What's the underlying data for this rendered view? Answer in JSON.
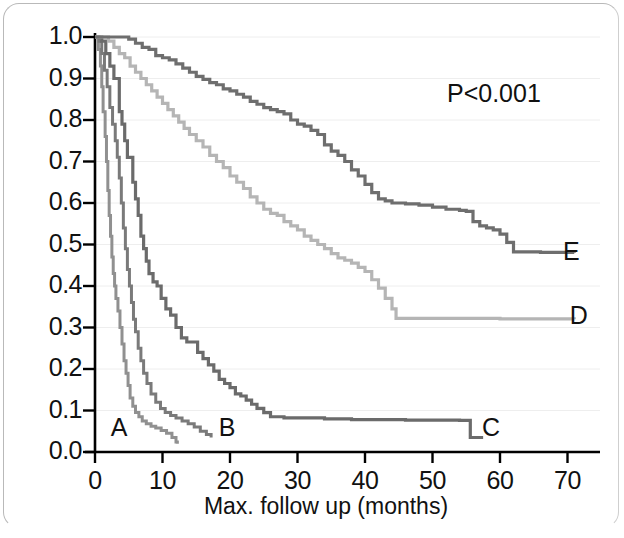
{
  "figure": {
    "annotation_pvalue": "P<0.001",
    "frame_color": "#b9b9b9",
    "background": "#ffffff"
  },
  "chart_data": {
    "type": "line",
    "subtype": "kaplan-meier-step",
    "title": "",
    "xlabel": "Max. follow up (months)",
    "ylabel": "",
    "xlim": [
      0,
      73
    ],
    "ylim": [
      0.0,
      1.0
    ],
    "xticks": [
      0,
      10,
      20,
      30,
      40,
      50,
      60,
      70
    ],
    "xticklabels": [
      "0",
      "10",
      "20",
      "30",
      "40",
      "50",
      "60",
      "70"
    ],
    "yticks": [
      0.0,
      0.1,
      0.2,
      0.3,
      0.4,
      0.5,
      0.6,
      0.7,
      0.8,
      0.9,
      1.0
    ],
    "yticklabels": [
      "0.0",
      "0.1",
      "0.2",
      "0.3",
      "0.4",
      "0.5",
      "0.6",
      "0.7",
      "0.8",
      "0.9",
      "1.0"
    ],
    "grid": "horizontal-faint",
    "grid_color": "#eeeeee",
    "legend": "inline-end-labels",
    "annotations": [
      {
        "text": "P<0.001",
        "x": 53,
        "y": 0.89
      },
      {
        "text": "A",
        "x": 3.5,
        "y": 0.055
      },
      {
        "text": "B",
        "x": 19.5,
        "y": 0.055
      },
      {
        "text": "C",
        "x": 58.5,
        "y": 0.055
      },
      {
        "text": "D",
        "x": 71.5,
        "y": 0.325
      },
      {
        "text": "E",
        "x": 70.5,
        "y": 0.48
      }
    ],
    "series": [
      {
        "name": "A",
        "label": "A",
        "color": "#909090",
        "width": 3.0,
        "final_value": 0.02,
        "final_time": 12.2,
        "points": [
          [
            0.0,
            1.0
          ],
          [
            0.5,
            0.97
          ],
          [
            0.8,
            0.93
          ],
          [
            1.0,
            0.88
          ],
          [
            1.2,
            0.82
          ],
          [
            1.5,
            0.76
          ],
          [
            1.7,
            0.7
          ],
          [
            1.9,
            0.63
          ],
          [
            2.1,
            0.57
          ],
          [
            2.3,
            0.52
          ],
          [
            2.5,
            0.47
          ],
          [
            2.7,
            0.43
          ],
          [
            2.9,
            0.4
          ],
          [
            3.1,
            0.37
          ],
          [
            3.4,
            0.34
          ],
          [
            3.7,
            0.3
          ],
          [
            4.0,
            0.26
          ],
          [
            4.3,
            0.22
          ],
          [
            4.6,
            0.19
          ],
          [
            4.9,
            0.16
          ],
          [
            5.2,
            0.13
          ],
          [
            5.6,
            0.11
          ],
          [
            6.0,
            0.095
          ],
          [
            6.5,
            0.085
          ],
          [
            7.0,
            0.075
          ],
          [
            7.6,
            0.068
          ],
          [
            8.3,
            0.062
          ],
          [
            9.0,
            0.058
          ],
          [
            9.8,
            0.052
          ],
          [
            10.6,
            0.045
          ],
          [
            11.4,
            0.035
          ],
          [
            12.0,
            0.024
          ],
          [
            12.2,
            0.02
          ]
        ]
      },
      {
        "name": "B",
        "label": "B",
        "color": "#7a7a7a",
        "width": 3.0,
        "final_value": 0.035,
        "final_time": 17.2,
        "points": [
          [
            0.0,
            1.0
          ],
          [
            0.6,
            0.99
          ],
          [
            1.0,
            0.96
          ],
          [
            1.4,
            0.92
          ],
          [
            1.8,
            0.88
          ],
          [
            2.2,
            0.83
          ],
          [
            2.6,
            0.79
          ],
          [
            3.0,
            0.75
          ],
          [
            3.3,
            0.71
          ],
          [
            3.6,
            0.66
          ],
          [
            3.9,
            0.6
          ],
          [
            4.2,
            0.54
          ],
          [
            4.5,
            0.49
          ],
          [
            4.8,
            0.44
          ],
          [
            5.1,
            0.4
          ],
          [
            5.4,
            0.36
          ],
          [
            5.7,
            0.32
          ],
          [
            6.0,
            0.29
          ],
          [
            6.4,
            0.25
          ],
          [
            6.8,
            0.22
          ],
          [
            7.2,
            0.19
          ],
          [
            7.7,
            0.165
          ],
          [
            8.3,
            0.14
          ],
          [
            9.0,
            0.12
          ],
          [
            9.7,
            0.105
          ],
          [
            10.4,
            0.095
          ],
          [
            11.2,
            0.088
          ],
          [
            12.0,
            0.082
          ],
          [
            12.9,
            0.075
          ],
          [
            13.8,
            0.068
          ],
          [
            14.7,
            0.06
          ],
          [
            15.6,
            0.05
          ],
          [
            16.5,
            0.042
          ],
          [
            17.2,
            0.035
          ]
        ]
      },
      {
        "name": "C",
        "label": "C",
        "color": "#6b6b6b",
        "width": 3.2,
        "final_value": 0.035,
        "final_time": 57.5,
        "points": [
          [
            0.0,
            1.0
          ],
          [
            1.0,
            0.99
          ],
          [
            1.6,
            0.96
          ],
          [
            2.2,
            0.93
          ],
          [
            2.8,
            0.9
          ],
          [
            3.2,
            0.9
          ],
          [
            3.6,
            0.82
          ],
          [
            4.0,
            0.79
          ],
          [
            4.4,
            0.75
          ],
          [
            4.8,
            0.71
          ],
          [
            5.2,
            0.71
          ],
          [
            5.6,
            0.65
          ],
          [
            6.0,
            0.61
          ],
          [
            6.4,
            0.57
          ],
          [
            6.8,
            0.52
          ],
          [
            7.2,
            0.49
          ],
          [
            7.6,
            0.46
          ],
          [
            8.0,
            0.43
          ],
          [
            8.6,
            0.41
          ],
          [
            9.2,
            0.4
          ],
          [
            9.8,
            0.37
          ],
          [
            10.5,
            0.345
          ],
          [
            11.2,
            0.33
          ],
          [
            12.0,
            0.3
          ],
          [
            12.8,
            0.275
          ],
          [
            13.6,
            0.265
          ],
          [
            14.4,
            0.265
          ],
          [
            15.2,
            0.24
          ],
          [
            16.0,
            0.225
          ],
          [
            16.8,
            0.21
          ],
          [
            17.6,
            0.195
          ],
          [
            18.4,
            0.175
          ],
          [
            19.2,
            0.165
          ],
          [
            20.0,
            0.155
          ],
          [
            20.8,
            0.14
          ],
          [
            21.6,
            0.135
          ],
          [
            22.4,
            0.125
          ],
          [
            23.2,
            0.115
          ],
          [
            24.0,
            0.105
          ],
          [
            25.0,
            0.095
          ],
          [
            26.0,
            0.085
          ],
          [
            28.0,
            0.082
          ],
          [
            30.0,
            0.082
          ],
          [
            34.0,
            0.08
          ],
          [
            38.0,
            0.078
          ],
          [
            42.0,
            0.078
          ],
          [
            46.0,
            0.077
          ],
          [
            50.0,
            0.077
          ],
          [
            54.0,
            0.076
          ],
          [
            55.2,
            0.076
          ],
          [
            55.6,
            0.035
          ],
          [
            57.5,
            0.035
          ]
        ]
      },
      {
        "name": "D",
        "label": "D",
        "color": "#b5b5b5",
        "width": 3.2,
        "final_value": 0.32,
        "final_time": 71.0,
        "points": [
          [
            0.0,
            1.0
          ],
          [
            1.2,
            1.0
          ],
          [
            2.0,
            0.99
          ],
          [
            2.8,
            0.975
          ],
          [
            3.6,
            0.96
          ],
          [
            4.4,
            0.95
          ],
          [
            5.2,
            0.93
          ],
          [
            6.0,
            0.915
          ],
          [
            6.8,
            0.9
          ],
          [
            7.6,
            0.885
          ],
          [
            8.4,
            0.87
          ],
          [
            9.2,
            0.855
          ],
          [
            10.0,
            0.84
          ],
          [
            10.8,
            0.825
          ],
          [
            11.6,
            0.81
          ],
          [
            12.4,
            0.795
          ],
          [
            13.2,
            0.78
          ],
          [
            14.0,
            0.765
          ],
          [
            15.0,
            0.75
          ],
          [
            16.0,
            0.735
          ],
          [
            17.0,
            0.715
          ],
          [
            18.0,
            0.7
          ],
          [
            19.0,
            0.685
          ],
          [
            20.0,
            0.665
          ],
          [
            21.0,
            0.65
          ],
          [
            22.0,
            0.635
          ],
          [
            23.0,
            0.615
          ],
          [
            24.0,
            0.6
          ],
          [
            25.0,
            0.585
          ],
          [
            26.0,
            0.575
          ],
          [
            27.0,
            0.57
          ],
          [
            28.0,
            0.555
          ],
          [
            29.0,
            0.545
          ],
          [
            30.0,
            0.535
          ],
          [
            31.0,
            0.52
          ],
          [
            32.0,
            0.51
          ],
          [
            33.0,
            0.5
          ],
          [
            34.0,
            0.49
          ],
          [
            35.0,
            0.478
          ],
          [
            36.0,
            0.468
          ],
          [
            37.0,
            0.462
          ],
          [
            38.0,
            0.455
          ],
          [
            39.0,
            0.445
          ],
          [
            40.0,
            0.435
          ],
          [
            41.0,
            0.415
          ],
          [
            42.0,
            0.395
          ],
          [
            43.0,
            0.37
          ],
          [
            44.0,
            0.345
          ],
          [
            44.6,
            0.322
          ],
          [
            50.0,
            0.322
          ],
          [
            60.0,
            0.321
          ],
          [
            71.0,
            0.32
          ]
        ]
      },
      {
        "name": "E",
        "label": "E",
        "color": "#6e6e6e",
        "width": 3.2,
        "final_value": 0.48,
        "final_time": 71.0,
        "points": [
          [
            0.0,
            1.0
          ],
          [
            2.0,
            1.0
          ],
          [
            4.0,
            1.0
          ],
          [
            5.0,
            0.995
          ],
          [
            6.0,
            0.985
          ],
          [
            7.0,
            0.975
          ],
          [
            8.0,
            0.97
          ],
          [
            9.0,
            0.955
          ],
          [
            10.0,
            0.95
          ],
          [
            11.0,
            0.945
          ],
          [
            12.0,
            0.935
          ],
          [
            13.0,
            0.925
          ],
          [
            14.0,
            0.915
          ],
          [
            15.0,
            0.905
          ],
          [
            16.0,
            0.898
          ],
          [
            17.0,
            0.89
          ],
          [
            18.0,
            0.885
          ],
          [
            19.0,
            0.875
          ],
          [
            20.0,
            0.87
          ],
          [
            21.0,
            0.862
          ],
          [
            22.0,
            0.855
          ],
          [
            23.0,
            0.845
          ],
          [
            24.0,
            0.838
          ],
          [
            25.0,
            0.83
          ],
          [
            26.0,
            0.825
          ],
          [
            27.0,
            0.82
          ],
          [
            28.0,
            0.815
          ],
          [
            29.0,
            0.8
          ],
          [
            30.0,
            0.79
          ],
          [
            31.0,
            0.785
          ],
          [
            32.0,
            0.775
          ],
          [
            33.0,
            0.765
          ],
          [
            34.0,
            0.74
          ],
          [
            35.0,
            0.725
          ],
          [
            36.0,
            0.715
          ],
          [
            37.0,
            0.7
          ],
          [
            38.0,
            0.68
          ],
          [
            39.0,
            0.665
          ],
          [
            40.0,
            0.645
          ],
          [
            41.0,
            0.625
          ],
          [
            42.0,
            0.61
          ],
          [
            43.0,
            0.605
          ],
          [
            44.0,
            0.6
          ],
          [
            46.0,
            0.598
          ],
          [
            48.0,
            0.595
          ],
          [
            50.0,
            0.59
          ],
          [
            52.0,
            0.585
          ],
          [
            54.0,
            0.582
          ],
          [
            55.0,
            0.58
          ],
          [
            56.0,
            0.555
          ],
          [
            57.0,
            0.545
          ],
          [
            58.0,
            0.54
          ],
          [
            59.0,
            0.535
          ],
          [
            60.0,
            0.525
          ],
          [
            61.0,
            0.505
          ],
          [
            62.0,
            0.482
          ],
          [
            66.0,
            0.481
          ],
          [
            71.0,
            0.48
          ]
        ]
      }
    ]
  }
}
